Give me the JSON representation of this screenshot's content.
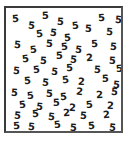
{
  "image": {
    "kind": "visual-search-stimulus",
    "description": "Bordered square field of rotated digit characters, mostly 5s with several 2s",
    "background_color": "#ffffff",
    "glyph_color": "#1b1b1b",
    "border_color": "#3a3a3a"
  },
  "frame": {
    "x": 4,
    "y": 6,
    "width": 119,
    "height": 127,
    "border_width": 2
  },
  "counts": {
    "total": 60,
    "fives": 52,
    "twos": 8
  },
  "glyphs": [
    {
      "char": "5",
      "x": 6,
      "y": 6,
      "rot": -4
    },
    {
      "char": "5",
      "x": 22,
      "y": 13,
      "rot": 6
    },
    {
      "char": "5",
      "x": 36,
      "y": 3,
      "rot": -2
    },
    {
      "char": "5",
      "x": 51,
      "y": 9,
      "rot": 4
    },
    {
      "char": "5",
      "x": 66,
      "y": 13,
      "rot": -6
    },
    {
      "char": "5",
      "x": 79,
      "y": 16,
      "rot": 3
    },
    {
      "char": "5",
      "x": 92,
      "y": 5,
      "rot": -3
    },
    {
      "char": "5",
      "x": 109,
      "y": 7,
      "rot": 5
    },
    {
      "char": "5",
      "x": 30,
      "y": 21,
      "rot": -7
    },
    {
      "char": "5",
      "x": 44,
      "y": 20,
      "rot": 8
    },
    {
      "char": "5",
      "x": 58,
      "y": 25,
      "rot": -4
    },
    {
      "char": "5",
      "x": 100,
      "y": 19,
      "rot": 2
    },
    {
      "char": "5",
      "x": 8,
      "y": 32,
      "rot": 5
    },
    {
      "char": "5",
      "x": 24,
      "y": 37,
      "rot": -6
    },
    {
      "char": "5",
      "x": 40,
      "y": 31,
      "rot": 3
    },
    {
      "char": "5",
      "x": 55,
      "y": 34,
      "rot": -5
    },
    {
      "char": "5",
      "x": 69,
      "y": 37,
      "rot": 7
    },
    {
      "char": "5",
      "x": 85,
      "y": 31,
      "rot": -3
    },
    {
      "char": "5",
      "x": 104,
      "y": 34,
      "rot": 4
    },
    {
      "char": "5",
      "x": 16,
      "y": 46,
      "rot": -8
    },
    {
      "char": "5",
      "x": 34,
      "y": 48,
      "rot": 4
    },
    {
      "char": "5",
      "x": 50,
      "y": 43,
      "rot": -2
    },
    {
      "char": "5",
      "x": 64,
      "y": 47,
      "rot": 6
    },
    {
      "char": "2",
      "x": 80,
      "y": 45,
      "rot": -4
    },
    {
      "char": "5",
      "x": 103,
      "y": 48,
      "rot": 3
    },
    {
      "char": "5",
      "x": 7,
      "y": 58,
      "rot": 5
    },
    {
      "char": "5",
      "x": 27,
      "y": 57,
      "rot": -5
    },
    {
      "char": "5",
      "x": 45,
      "y": 59,
      "rot": 7
    },
    {
      "char": "5",
      "x": 60,
      "y": 55,
      "rot": -3
    },
    {
      "char": "5",
      "x": 88,
      "y": 57,
      "rot": 4
    },
    {
      "char": "5",
      "x": 110,
      "y": 56,
      "rot": -6
    },
    {
      "char": "5",
      "x": 18,
      "y": 68,
      "rot": -4
    },
    {
      "char": "5",
      "x": 36,
      "y": 70,
      "rot": 6
    },
    {
      "char": "5",
      "x": 56,
      "y": 67,
      "rot": -7
    },
    {
      "char": "2",
      "x": 72,
      "y": 69,
      "rot": 3
    },
    {
      "char": "5",
      "x": 96,
      "y": 66,
      "rot": -2
    },
    {
      "char": "5",
      "x": 107,
      "y": 72,
      "rot": 5
    },
    {
      "char": "5",
      "x": 5,
      "y": 80,
      "rot": 4
    },
    {
      "char": "5",
      "x": 21,
      "y": 83,
      "rot": -6
    },
    {
      "char": "5",
      "x": 40,
      "y": 81,
      "rot": 3
    },
    {
      "char": "5",
      "x": 54,
      "y": 84,
      "rot": -4
    },
    {
      "char": "2",
      "x": 70,
      "y": 79,
      "rot": 6
    },
    {
      "char": "2",
      "x": 90,
      "y": 82,
      "rot": -3
    },
    {
      "char": "5",
      "x": 105,
      "y": 79,
      "rot": 5
    },
    {
      "char": "5",
      "x": 13,
      "y": 92,
      "rot": -5
    },
    {
      "char": "5",
      "x": 30,
      "y": 94,
      "rot": 7
    },
    {
      "char": "5",
      "x": 47,
      "y": 90,
      "rot": -2
    },
    {
      "char": "2",
      "x": 63,
      "y": 95,
      "rot": 4
    },
    {
      "char": "5",
      "x": 80,
      "y": 92,
      "rot": -6
    },
    {
      "char": "2",
      "x": 101,
      "y": 93,
      "rot": 3
    },
    {
      "char": "5",
      "x": 8,
      "y": 103,
      "rot": 6
    },
    {
      "char": "5",
      "x": 26,
      "y": 101,
      "rot": -4
    },
    {
      "char": "5",
      "x": 42,
      "y": 104,
      "rot": 5
    },
    {
      "char": "2",
      "x": 57,
      "y": 100,
      "rot": -3
    },
    {
      "char": "5",
      "x": 74,
      "y": 103,
      "rot": 4
    },
    {
      "char": "2",
      "x": 97,
      "y": 102,
      "rot": -5
    },
    {
      "char": "5",
      "x": 7,
      "y": 113,
      "rot": -3
    },
    {
      "char": "5",
      "x": 22,
      "y": 114,
      "rot": 5
    },
    {
      "char": "5",
      "x": 48,
      "y": 112,
      "rot": -6
    },
    {
      "char": "5",
      "x": 64,
      "y": 115,
      "rot": 3
    },
    {
      "char": "5",
      "x": 82,
      "y": 113,
      "rot": -4
    },
    {
      "char": "5",
      "x": 103,
      "y": 115,
      "rot": 6
    }
  ]
}
